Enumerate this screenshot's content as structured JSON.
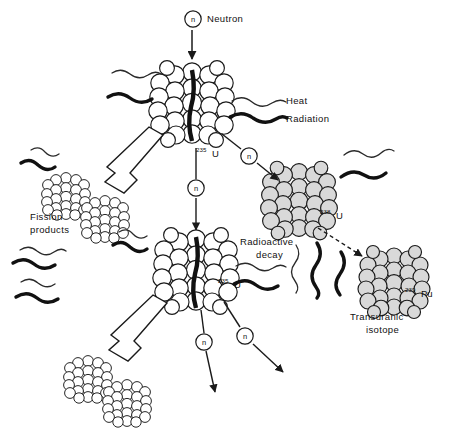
{
  "diagram": {
    "background_color": "#ffffff",
    "ink_color": "#1a1a1a",
    "nucleus_fill_light": "#ffffff",
    "nucleus_fill_gray": "#d9d9d9"
  },
  "labels": {
    "neutron": "Neutron",
    "heat": "Heat",
    "radiation": "Radiation",
    "fission_products_line1": "Fission",
    "fission_products_line2": "products",
    "radioactive_decay_line1": "Radioactive",
    "radioactive_decay_line2": "decay",
    "transuranic_line1": "Transuranic",
    "transuranic_line2": "isotope",
    "neutron_symbol": "n"
  },
  "isotopes": {
    "u235_top": {
      "mass_number": "235",
      "symbol": "U"
    },
    "u235_bottom": {
      "mass_number": "235",
      "symbol": "U"
    },
    "u238": {
      "mass_number": "238",
      "symbol": "U"
    },
    "pu239": {
      "mass_number": "239",
      "symbol": "Pu"
    }
  },
  "emissions": [
    {
      "name": "heat",
      "style": "thin-wave",
      "label": "Heat"
    },
    {
      "name": "radiation",
      "style": "thick-wave",
      "label": "Radiation"
    }
  ],
  "neutron_markers": [
    {
      "id": "incoming-neutron",
      "label": "n",
      "x": 193,
      "y": 19
    },
    {
      "id": "neutron-to-u235-lower",
      "label": "n",
      "x": 196,
      "y": 188
    },
    {
      "id": "neutron-to-u238",
      "label": "n",
      "x": 249,
      "y": 156
    },
    {
      "id": "neutron-emitted-left",
      "label": "n",
      "x": 204,
      "y": 342
    },
    {
      "id": "neutron-emitted-right",
      "label": "n",
      "x": 245,
      "y": 336
    }
  ],
  "nuclei": [
    {
      "id": "u235-top",
      "type": "fissile",
      "cx": 192,
      "cy": 107,
      "r": 37,
      "split": true
    },
    {
      "id": "u235-bottom",
      "type": "fissile",
      "cx": 196,
      "cy": 273,
      "r": 37,
      "split": true
    },
    {
      "id": "u238",
      "type": "fertile",
      "cx": 299,
      "cy": 199,
      "r": 32,
      "split": false
    },
    {
      "id": "pu239",
      "type": "transuranic",
      "cx": 394,
      "cy": 280,
      "r": 30,
      "split": false
    },
    {
      "id": "fission-product-1",
      "type": "fragment",
      "cx": 66,
      "cy": 195,
      "r": 21,
      "split": false
    },
    {
      "id": "fission-product-2",
      "type": "fragment",
      "cx": 105,
      "cy": 218,
      "r": 21,
      "split": false
    },
    {
      "id": "fission-product-3",
      "type": "fragment",
      "cx": 88,
      "cy": 378,
      "r": 21,
      "split": false
    },
    {
      "id": "fission-product-4",
      "type": "fragment",
      "cx": 127,
      "cy": 402,
      "r": 21,
      "split": false
    }
  ]
}
